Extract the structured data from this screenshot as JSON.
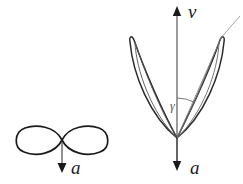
{
  "figure": {
    "background_color": "#ffffff",
    "stroke_color": "#1a1a1a",
    "faint_stroke_color": "#888888",
    "width": 243,
    "height": 184,
    "panels": [
      {
        "id": "left-panel",
        "name": "lemniscate-panel",
        "curve_type": "lemniscate",
        "description": "horizontal figure-eight curve",
        "center": [
          62,
          140
        ],
        "lobe_half_width": 47,
        "lobe_half_height": 16,
        "vector": {
          "name": "acceleration-vector",
          "label": "a",
          "direction": "down",
          "from": [
            62,
            140
          ],
          "to": [
            62,
            172
          ]
        }
      },
      {
        "id": "right-panel",
        "name": "two-lobe-panel",
        "curve_type": "two-petal-loop",
        "description": "two narrow elongated loops meeting at a cusp with vertical axis",
        "cusp": [
          177,
          138
        ],
        "axis": {
          "name": "velocity-axis",
          "label": "v",
          "direction": "up",
          "from": [
            177,
            165
          ],
          "to": [
            177,
            8
          ]
        },
        "vector": {
          "name": "acceleration-vector",
          "label": "a",
          "direction": "down",
          "from": [
            177,
            138
          ],
          "to": [
            177,
            170
          ]
        },
        "angle": {
          "name": "gamma-angle",
          "label": "γ",
          "arc_radius": 40,
          "vertex": [
            177,
            138
          ],
          "from_ray": "vertical-axis",
          "to_ray": "slant-ray"
        },
        "left_lobe_tip": [
          133,
          38
        ],
        "right_lobe_tip": [
          221,
          37
        ],
        "tangent_ray_end": [
          238,
          18
        ]
      }
    ]
  },
  "labels": {
    "left_acceleration": "a",
    "right_velocity": "v",
    "right_acceleration": "a",
    "angle_gamma": "γ"
  }
}
